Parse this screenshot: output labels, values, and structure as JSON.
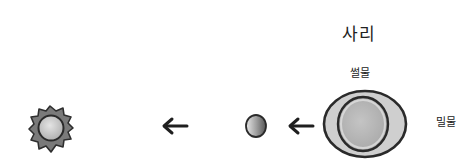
{
  "diagram": {
    "title": "사리",
    "labels": {
      "ebb_tide": "썰물",
      "flood_tide": "밀물"
    },
    "objects": [
      {
        "name": "sun",
        "icon": "sun-icon"
      },
      {
        "name": "moon",
        "icon": "moon-icon"
      },
      {
        "name": "earth",
        "icon": "earth-with-tidal-bulge-icon"
      }
    ],
    "arrows": [
      {
        "from": "moon",
        "to": "sun",
        "direction": "left"
      },
      {
        "from": "earth",
        "to": "moon",
        "direction": "left"
      }
    ],
    "colors": {
      "outline": "#2a2a2a",
      "fill_dark": "#777777",
      "fill_light": "#c8c8c8",
      "water": "#d0d0d0",
      "earth": "#b4b4b4"
    }
  }
}
